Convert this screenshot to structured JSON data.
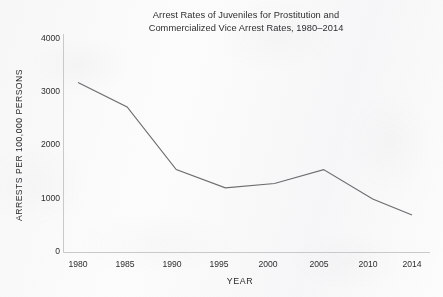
{
  "chart_data": {
    "type": "line",
    "title": "Arrest Rates of Juveniles for Prostitution and Commercialized Vice Arrest Rates, 1980–2014",
    "title_line1": "Arrest Rates of Juveniles for Prostitution and",
    "title_line2": "Commercialized Vice Arrest Rates, 1980–2014",
    "xlabel": "YEAR",
    "ylabel": "ARRESTS PER 100,000 PERSONS",
    "x": [
      1980,
      1985,
      1990,
      1995,
      2000,
      2005,
      2010,
      2014
    ],
    "categories": [
      "1980",
      "1985",
      "1990",
      "1995",
      "2000",
      "2005",
      "2010",
      "2014"
    ],
    "values": [
      3170,
      2710,
      1540,
      1200,
      1280,
      1540,
      990,
      690
    ],
    "series": [
      {
        "name": "Juvenile prostitution and commercialized vice arrest rate",
        "values": [
          3170,
          2710,
          1540,
          1200,
          1280,
          1540,
          990,
          690
        ]
      }
    ],
    "xlim": [
      1980,
      2014
    ],
    "ylim": [
      0,
      4000
    ],
    "ytick_labels": [
      "0",
      "1000",
      "2000",
      "3000",
      "4000"
    ],
    "ytick_values": [
      0,
      1000,
      2000,
      3000,
      4000
    ],
    "xtick_labels": [
      "1980",
      "1985",
      "1990",
      "1995",
      "2000",
      "2005",
      "2010",
      "2014"
    ],
    "xtick_values": [
      1980,
      1985,
      1990,
      1995,
      2000,
      2005,
      2010,
      2014
    ],
    "grid": false,
    "legend": false,
    "line_color": "#6d6d70",
    "axis_color": "#c9c9cc",
    "text_color": "#2d2d2f",
    "background_color": "#fcfcfc"
  }
}
